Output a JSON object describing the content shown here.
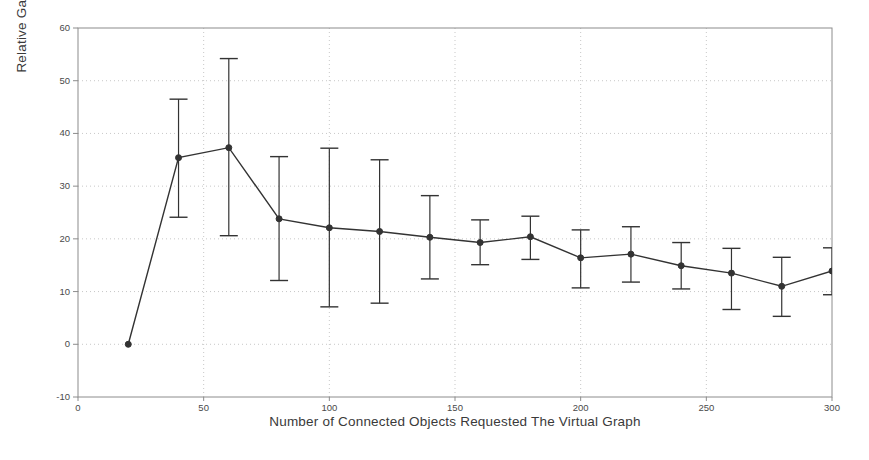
{
  "figure": {
    "background_color": "#ffffff",
    "axis_color": "#8c8c8c",
    "grid_color": "#b9b9b9",
    "series_color": "#333333"
  },
  "chart_data": {
    "type": "line",
    "title": "",
    "xlabel": "Number of Connected Objects Requested The Virtual Graph",
    "ylabel": "Relative Gain (%)",
    "xlim": [
      0,
      300
    ],
    "ylim": [
      -10,
      60
    ],
    "xticks": [
      0,
      50,
      100,
      150,
      200,
      250,
      300
    ],
    "xtick_labels": [
      "0",
      "50",
      "100",
      "150",
      "200",
      "250",
      "300"
    ],
    "yticks": [
      -10,
      0,
      10,
      20,
      30,
      40,
      50,
      60
    ],
    "ytick_labels": [
      "-10",
      "0",
      "10",
      "20",
      "30",
      "40",
      "50",
      "60"
    ],
    "grid": true,
    "grid_style": "dotted",
    "legend": null,
    "marker": "circle",
    "errorbars": true,
    "x": [
      20,
      40,
      60,
      80,
      100,
      120,
      140,
      160,
      180,
      200,
      220,
      240,
      260,
      280,
      300
    ],
    "values": [
      0.0,
      35.4,
      37.3,
      23.8,
      22.1,
      21.4,
      20.3,
      19.3,
      20.4,
      16.4,
      17.1,
      14.9,
      13.5,
      11.0,
      13.9
    ],
    "err_low": [
      0.0,
      24.1,
      20.6,
      12.1,
      7.1,
      7.8,
      12.4,
      15.1,
      16.1,
      10.7,
      11.8,
      10.5,
      6.6,
      5.3,
      9.4
    ],
    "err_high": [
      0.0,
      46.5,
      54.2,
      35.6,
      37.2,
      35.0,
      28.2,
      23.6,
      24.3,
      21.7,
      22.3,
      19.3,
      18.2,
      16.5,
      18.3
    ]
  }
}
